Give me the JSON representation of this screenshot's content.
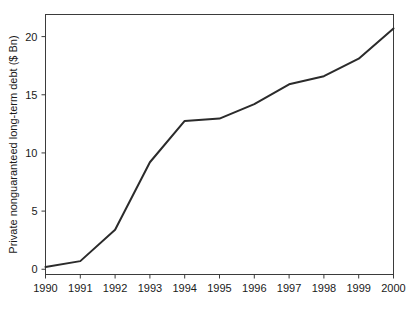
{
  "chart_data": {
    "type": "line",
    "title": "",
    "subtitle": "",
    "xlabel": "",
    "ylabel": "Private nonguaranteed long-term debt ($ Bn)",
    "x": [
      1990,
      1991,
      1992,
      1993,
      1994,
      1995,
      1996,
      1997,
      1998,
      1999,
      2000
    ],
    "values": [
      0.2,
      0.7,
      3.4,
      9.2,
      12.75,
      12.95,
      14.2,
      15.9,
      16.6,
      18.1,
      20.7
    ],
    "series": [
      {
        "name": "Private nonguaranteed long-term debt",
        "values": [
          0.2,
          0.7,
          3.4,
          9.2,
          12.75,
          12.95,
          14.2,
          15.9,
          16.6,
          18.1,
          20.7
        ],
        "color": "#2b2b2b"
      }
    ],
    "xlim": [
      1990,
      2000
    ],
    "ylim": [
      -0.45,
      21.9
    ],
    "xticks": [
      1990,
      1991,
      1992,
      1993,
      1994,
      1995,
      1996,
      1997,
      1998,
      1999,
      2000
    ],
    "xticklabels": [
      "1990",
      "1991",
      "1992",
      "1993",
      "1994",
      "1995",
      "1996",
      "1997",
      "1998",
      "1999",
      "2000"
    ],
    "yticks": [
      0,
      5,
      10,
      15,
      20
    ],
    "yticklabels": [
      "0",
      "5",
      "10",
      "15",
      "20"
    ],
    "grid": false,
    "legend": false,
    "legend_position": "none",
    "frame": true,
    "annotations": []
  }
}
